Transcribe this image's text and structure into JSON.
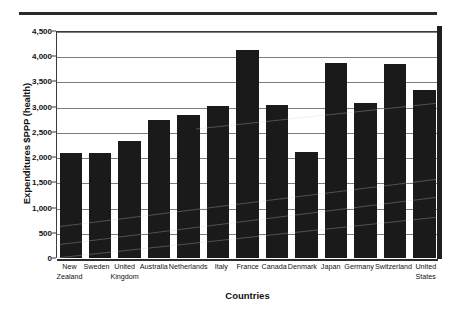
{
  "chart_data": {
    "type": "bar",
    "title": "",
    "xlabel": "Countries",
    "ylabel": "Expenditures $PPP (health)",
    "categories": [
      "New Zealand",
      "Sweden",
      "United Kingdom",
      "Australia",
      "Netherlands",
      "Italy",
      "France",
      "Canada",
      "Denmark",
      "Japan",
      "Germany",
      "Switzerland",
      "United States"
    ],
    "values": [
      2080,
      2090,
      2320,
      2740,
      2840,
      3020,
      4130,
      3030,
      2110,
      3870,
      3070,
      3840,
      3330
    ],
    "ylim": [
      0,
      4500
    ],
    "ytick_values": [
      0,
      500,
      1000,
      1500,
      2000,
      2500,
      3000,
      3500,
      4000,
      4500
    ],
    "ytick_labels": [
      "0",
      "500",
      "1,000",
      "1,500",
      "2,000",
      "2,500",
      "3,000",
      "3,500",
      "4,000",
      "4,500"
    ],
    "grid": true,
    "legend": false,
    "bar_color": "#1a1a1a",
    "gridline_color": "#7d7d7d",
    "axis_color": "#2b2b2b"
  },
  "figure": {
    "top_rule_color": "#2a2a2a"
  }
}
